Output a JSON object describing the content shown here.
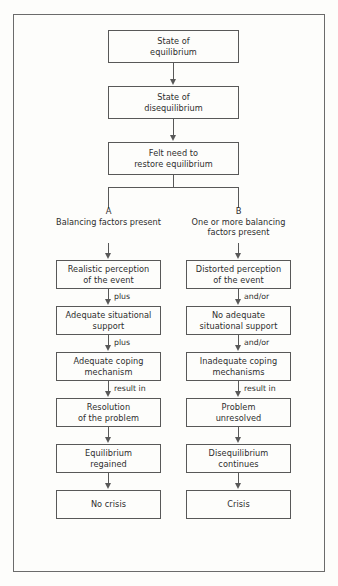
{
  "diagram": {
    "type": "flowchart",
    "colors": {
      "background": "#fdfdfb",
      "box_border": "#585858",
      "frame_border": "#6b6b6b",
      "text": "#2e2e2e",
      "connector": "#585858"
    },
    "trunk": [
      {
        "id": "state-of-equilibrium",
        "line1": "State of",
        "line2": "equilibrium"
      },
      {
        "id": "state-of-disequilibrium",
        "line1": "State of",
        "line2": "disequilibrium"
      },
      {
        "id": "felt-need",
        "line1": "Felt need to",
        "line2": "restore equilibrium"
      }
    ],
    "branches": [
      {
        "letter": "A",
        "caption_line1": "Balancing factors",
        "caption_line2": "present",
        "steps": [
          {
            "id": "realistic-perception",
            "line1": "Realistic perception",
            "line2": "of the event"
          },
          {
            "id": "adequate-situational-support",
            "line1": "Adequate situational",
            "line2": "support"
          },
          {
            "id": "adequate-coping-mechanism",
            "line1": "Adequate coping",
            "line2": "mechanism"
          },
          {
            "id": "resolution-of-the-problem",
            "line1": "Resolution",
            "line2": "of the problem"
          },
          {
            "id": "equilibrium-regained",
            "line1": "Equilibrium",
            "line2": "regained"
          },
          {
            "id": "no-crisis",
            "line1": "No crisis",
            "line2": ""
          }
        ],
        "connector_labels": [
          "plus",
          "plus",
          "result in",
          "",
          ""
        ]
      },
      {
        "letter": "B",
        "caption_line1": "One or more balancing",
        "caption_line2": "factors present",
        "steps": [
          {
            "id": "distorted-perception",
            "line1": "Distorted perception",
            "line2": "of the event"
          },
          {
            "id": "no-adequate-situational-support",
            "line1": "No adequate",
            "line2": "situational support"
          },
          {
            "id": "inadequate-coping-mechanisms",
            "line1": "Inadequate coping",
            "line2": "mechanisms"
          },
          {
            "id": "problem-unresolved",
            "line1": "Problem",
            "line2": "unresolved"
          },
          {
            "id": "disequilibrium-continues",
            "line1": "Disequilibrium",
            "line2": "continues"
          },
          {
            "id": "crisis",
            "line1": "Crisis",
            "line2": ""
          }
        ],
        "connector_labels": [
          "and/or",
          "and/or",
          "result in",
          "",
          ""
        ]
      }
    ]
  }
}
